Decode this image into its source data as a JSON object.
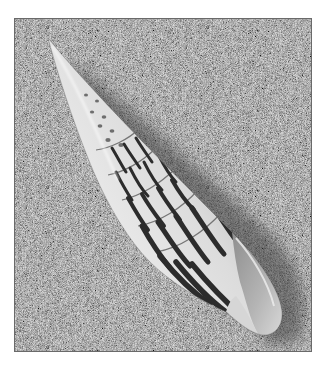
{
  "image": {
    "subject": "Striped auger seashell (Terebra) lying diagonally on sand",
    "alt": "Black-and-white photograph of a long tapering spiral seashell with dark vertical stripes on fine grey sand",
    "colors": {
      "border": "#ffffff",
      "sand": "#7a7a7a",
      "shell_light": "#e6e6e6",
      "shell_mid": "#c4c4c4",
      "stripe": "#2e2e2e",
      "shadow": "#4a4a4a"
    },
    "frame": {
      "x": 15,
      "y": 19,
      "width": 296,
      "height": 332
    },
    "shell": {
      "tip": [
        48,
        38
      ],
      "base": [
        275,
        335
      ]
    }
  }
}
